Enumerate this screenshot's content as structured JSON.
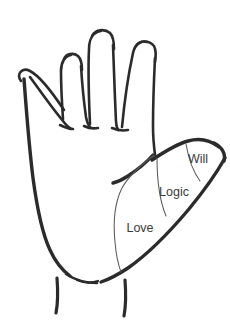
{
  "figure": {
    "background_color": "#ffffff",
    "outline_color": "#2b2b2b",
    "divider_color": "#595959",
    "label_color": "#3a3a3a"
  },
  "zones": [
    {
      "id": "will",
      "label": "Will",
      "region": "thumb-tip",
      "x": 198,
      "y": 160
    },
    {
      "id": "logic",
      "label": "Logic",
      "region": "thumb-middle",
      "x": 174,
      "y": 193
    },
    {
      "id": "love",
      "label": "Love",
      "region": "thenar-base",
      "x": 140,
      "y": 229
    }
  ]
}
